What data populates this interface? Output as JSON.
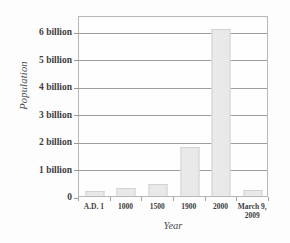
{
  "chart_data": {
    "type": "bar",
    "title": "",
    "xlabel": "Year",
    "ylabel": "Population",
    "categories": [
      "A.D. 1",
      "1000",
      "1500",
      "1900",
      "2000",
      "March 9, 2009"
    ],
    "category_lines": [
      [
        "A.D. 1"
      ],
      [
        "1000"
      ],
      [
        "1500"
      ],
      [
        "1900"
      ],
      [
        "2000"
      ],
      [
        "March 9,",
        "2009"
      ]
    ],
    "values": [
      0.2,
      0.31,
      0.45,
      1.8,
      6.1,
      0.22
    ],
    "value_unit": "billion",
    "ylim": [
      0,
      6.6
    ],
    "yticks": [
      0,
      1,
      2,
      3,
      4,
      5,
      6
    ],
    "ytick_labels": [
      "0",
      "1 billion",
      "2 billion",
      "3 billion",
      "4 billion",
      "5 billion",
      "6 billion"
    ],
    "grid": true,
    "legend": "none",
    "bar_color": "#e9e9e9",
    "bar_edge_color": "#d2d2d2",
    "grid_color": "#9d9d9d",
    "frame_color": "#b7b7b7",
    "text_color": "#3d3d3d"
  }
}
